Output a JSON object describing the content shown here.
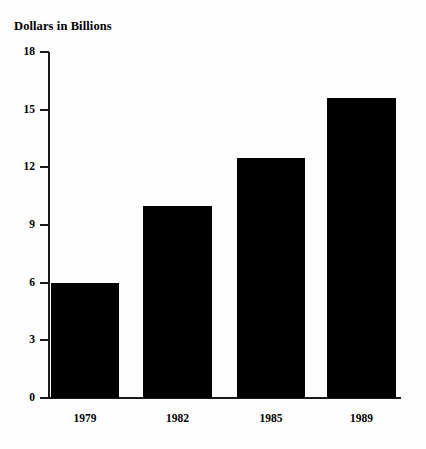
{
  "chart_data": {
    "type": "bar",
    "title": "Dollars in Billions",
    "xlabel": "",
    "ylabel": "",
    "categories": [
      "1979",
      "1982",
      "1985",
      "1989"
    ],
    "values": [
      6.0,
      10.0,
      12.5,
      15.6
    ],
    "ylim": [
      0,
      18
    ],
    "yticks": [
      0,
      3,
      6,
      9,
      12,
      15,
      18
    ],
    "ytick_labels": [
      "0",
      "3",
      "6",
      "9",
      "12",
      "15",
      "18"
    ],
    "grid": false,
    "legend": false,
    "bar_color": "#000000",
    "axis_color": "#1a1a1a",
    "background_color": "#fefefe"
  }
}
